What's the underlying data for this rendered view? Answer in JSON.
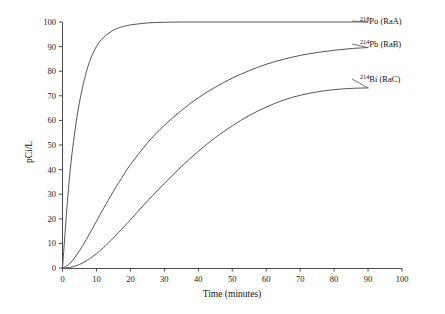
{
  "chart_data": {
    "type": "line",
    "title": "",
    "xlabel": "Time (minutes)",
    "ylabel": "pCi/L",
    "xlim": [
      0,
      100
    ],
    "ylim": [
      0,
      100
    ],
    "grid": false,
    "legend_position": "right-inline-labels",
    "xticks": [
      0,
      10,
      20,
      30,
      40,
      50,
      60,
      70,
      80,
      90,
      100
    ],
    "yticks": [
      0,
      10,
      20,
      30,
      40,
      50,
      60,
      70,
      80,
      90,
      100
    ],
    "xtick_labels": [
      "0",
      "10",
      "20",
      "30",
      "40",
      "50",
      "60",
      "70",
      "80",
      "90",
      "100"
    ],
    "ytick_labels": [
      "0",
      "10",
      "20",
      "30",
      "40",
      "50",
      "60",
      "70",
      "80",
      "90",
      "100"
    ],
    "x": [
      0,
      2,
      4,
      6,
      8,
      10,
      12,
      15,
      18,
      20,
      25,
      30,
      35,
      40,
      45,
      50,
      55,
      60,
      65,
      70,
      75,
      80,
      85,
      90
    ],
    "series": [
      {
        "name": "218Po (RaA)",
        "label_mass": "218",
        "label_element": "Po",
        "label_suffix": " (RaA)",
        "values": [
          0,
          36,
          59,
          74,
          84,
          90,
          93.6,
          96.7,
          98.2,
          98.8,
          99.6,
          99.9,
          100,
          100,
          100,
          100,
          100,
          100,
          100,
          100,
          100,
          100,
          100,
          100
        ],
        "end_value": 100
      },
      {
        "name": "214Pb (RaB)",
        "label_mass": "214",
        "label_element": "Pb",
        "label_suffix": " (RaB)",
        "values": [
          0,
          1.6,
          5.0,
          9.2,
          14.0,
          19.0,
          24.0,
          31.2,
          37.8,
          42.0,
          50.8,
          58.0,
          64.0,
          69.2,
          73.5,
          77.2,
          80.2,
          82.8,
          84.8,
          86.4,
          87.6,
          88.5,
          89.2,
          89.6
        ],
        "end_value": 89.6
      },
      {
        "name": "214Bi (RaC)",
        "label_mass": "214",
        "label_element": "Bi",
        "label_suffix": " (RaC)",
        "values": [
          0,
          0.2,
          0.9,
          2.1,
          3.8,
          5.8,
          8.2,
          12.2,
          16.6,
          19.6,
          27.2,
          34.4,
          41.2,
          47.4,
          53.0,
          57.8,
          62.0,
          65.4,
          68.2,
          70.2,
          71.6,
          72.5,
          73.0,
          73.2
        ],
        "end_value": 73.2
      }
    ]
  },
  "colors": {
    "axis": "#4a4a4a",
    "curve": "#555555",
    "text": "#1a1a1a",
    "background": "#ffffff"
  }
}
